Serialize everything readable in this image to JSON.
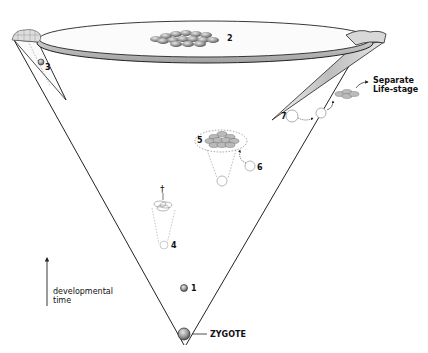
{
  "diagram": {
    "type": "developmental cone (epigenetic landscape)",
    "labels": {
      "zygote": "ZYGOTE",
      "separate_life_stage": [
        "Separate",
        "Life-stage"
      ],
      "axis": [
        "developmental",
        "time"
      ],
      "dagger": "†"
    },
    "numbered_points": [
      {
        "n": "1",
        "desc": "early cell near cone base"
      },
      {
        "n": "2",
        "desc": "cell cluster on top disc"
      },
      {
        "n": "3",
        "desc": "cell inside left rim fold"
      },
      {
        "n": "4",
        "desc": "dotted sub-cone ending in death"
      },
      {
        "n": "5",
        "desc": "dotted sub-cone with cell grid"
      },
      {
        "n": "6",
        "desc": "cell joining cluster 5"
      },
      {
        "n": "7",
        "desc": "cell leaving cone at right edge"
      }
    ],
    "colors": {
      "line": "#222222",
      "cell_fill": "#9a9a9a",
      "dotted": "#777777",
      "shade": "#cccccc"
    }
  }
}
